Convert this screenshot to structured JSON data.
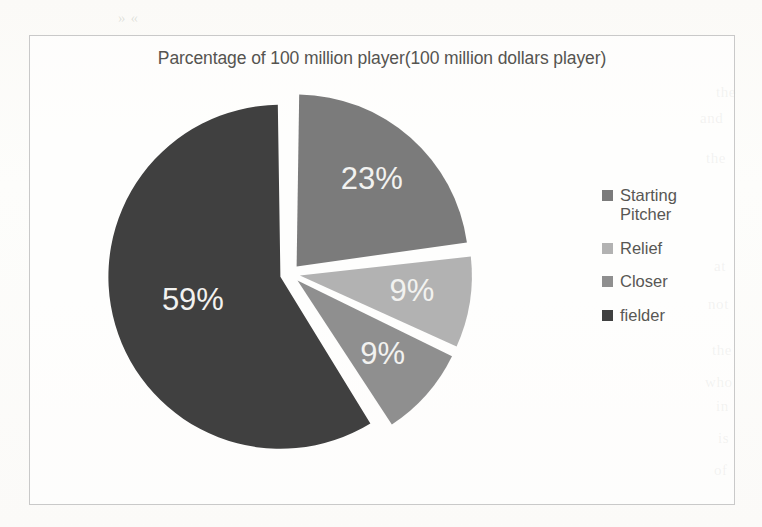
{
  "chart_data": {
    "type": "pie",
    "title": "Parcentage of 100 million player(100 million dollars player)",
    "xlabel": "",
    "ylabel": "",
    "legend_position": "right",
    "grid": false,
    "exploded": true,
    "start_angle_deg": 0,
    "categories": [
      "Starting Pitcher",
      "Relief",
      "Closer",
      "fielder"
    ],
    "values": [
      23,
      9,
      9,
      59
    ],
    "data_labels": [
      "23%",
      "9%",
      "9%",
      "59%"
    ],
    "colors": [
      "#7b7b7b",
      "#b2b2b2",
      "#8f8f8f",
      "#404040"
    ],
    "slices": [
      {
        "label": "Starting Pitcher",
        "value": 23,
        "data_label": "23%",
        "color": "#7b7b7b"
      },
      {
        "label": "Relief",
        "value": 9,
        "data_label": "9%",
        "color": "#b2b2b2"
      },
      {
        "label": "Closer",
        "value": 9,
        "data_label": "9%",
        "color": "#8f8f8f"
      },
      {
        "label": "fielder",
        "value": 59,
        "data_label": "59%",
        "color": "#404040"
      }
    ]
  },
  "chart": {
    "title": "Parcentage of 100 million player(100 million dollars player)",
    "border_color": "#c9c9c9"
  },
  "legend": {
    "items": [
      {
        "label": "Starting\nPitcher",
        "color": "#7b7b7b"
      },
      {
        "label": "Relief",
        "color": "#b2b2b2"
      },
      {
        "label": "Closer",
        "color": "#8f8f8f"
      },
      {
        "label": "fielder",
        "color": "#404040"
      }
    ]
  },
  "background_text": {
    "lines": [
      {
        "text": "» «",
        "x": 118,
        "y": 10
      },
      {
        "text": "the",
        "x": 716,
        "y": 84
      },
      {
        "text": "and",
        "x": 700,
        "y": 110
      },
      {
        "text": "the",
        "x": 706,
        "y": 150
      },
      {
        "text": "at",
        "x": 714,
        "y": 258
      },
      {
        "text": "not",
        "x": 708,
        "y": 296
      },
      {
        "text": "the",
        "x": 712,
        "y": 342
      },
      {
        "text": "who",
        "x": 705,
        "y": 374
      },
      {
        "text": "in",
        "x": 716,
        "y": 398
      },
      {
        "text": "is",
        "x": 718,
        "y": 430
      },
      {
        "text": "of",
        "x": 714,
        "y": 462
      }
    ]
  }
}
